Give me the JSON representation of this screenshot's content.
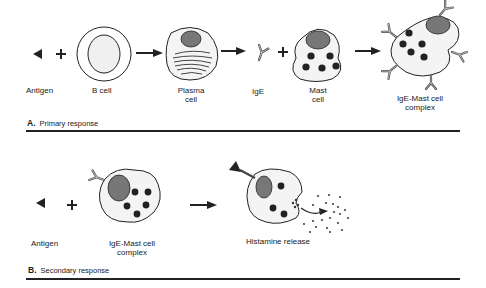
{
  "panel_a": {
    "letter": "A.",
    "title": "Primary response",
    "labels": {
      "antigen": "Antigen",
      "b_cell": "B cell",
      "plasma_cell_1": "Plasma",
      "plasma_cell_2": "cell",
      "ige": "IgE",
      "mast_cell_1": "Mast",
      "mast_cell_2": "cell",
      "complex_1": "IgE-Mast cell",
      "complex_2": "complex"
    }
  },
  "panel_b": {
    "letter": "B.",
    "title": "Secondary response",
    "labels": {
      "antigen": "Antigen",
      "complex_1": "IgE-Mast cell",
      "complex_2": "complex",
      "histamine": "Histamine release"
    }
  },
  "colors": {
    "ink": "#222222",
    "nucleus": "#7a7a7a",
    "cell_fill": "#f4f4f4",
    "granule": "#2a2a2a"
  }
}
